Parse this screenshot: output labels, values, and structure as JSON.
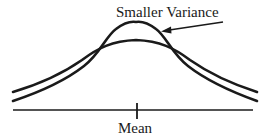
{
  "diagram": {
    "annotation_label": "Smaller Variance",
    "axis_label": "Mean",
    "curves": [
      {
        "name": "larger-variance-curve",
        "description": "wider, flatter bell curve"
      },
      {
        "name": "smaller-variance-curve",
        "description": "narrower, taller bell curve"
      }
    ],
    "colors": {
      "stroke": "#1a1a1a",
      "background": "#ffffff"
    }
  }
}
